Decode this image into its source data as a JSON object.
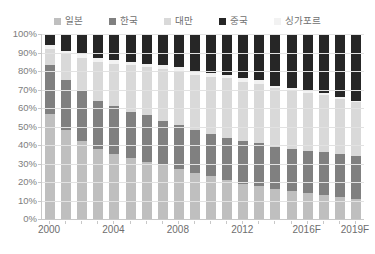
{
  "chart_data": {
    "type": "bar",
    "subtype": "stacked-percent",
    "title": "",
    "xlabel": "",
    "ylabel": "",
    "ylim": [
      0,
      100
    ],
    "ytick_labels": [
      "100%",
      "90%",
      "80%",
      "70%",
      "60%",
      "50%",
      "40%",
      "30%",
      "20%",
      "10%",
      "0%"
    ],
    "ytick_values": [
      100,
      90,
      80,
      70,
      60,
      50,
      40,
      30,
      20,
      10,
      0
    ],
    "grid": true,
    "legend_position": "top",
    "categories": [
      "2000",
      "2001",
      "2002",
      "2003",
      "2004",
      "2005",
      "2006",
      "2007",
      "2008",
      "2009",
      "2010",
      "2011",
      "2012",
      "2013",
      "2014",
      "2015",
      "2016F",
      "2017F",
      "2018F",
      "2019F"
    ],
    "xtick_labels_shown": [
      "2000",
      "2004",
      "2008",
      "2012",
      "2016F",
      "2019F"
    ],
    "series": [
      {
        "name": "일본",
        "color": "#bfbfbf",
        "values": [
          57,
          48,
          42,
          38,
          35,
          33,
          31,
          29,
          27,
          25,
          23,
          21,
          19,
          18,
          16,
          15,
          14,
          13,
          12,
          11
        ]
      },
      {
        "name": "한국",
        "color": "#808080",
        "values": [
          26,
          27,
          27,
          26,
          26,
          25,
          25,
          24,
          24,
          23,
          23,
          23,
          23,
          23,
          23,
          23,
          23,
          23,
          23,
          23
        ]
      },
      {
        "name": "대만",
        "color": "#d9d9d9",
        "values": [
          9,
          14,
          18,
          21,
          23,
          25,
          26,
          28,
          29,
          30,
          31,
          32,
          32,
          32,
          32,
          32,
          31,
          31,
          30,
          29
        ]
      },
      {
        "name": "싱가포르",
        "color": "#f2f2f2",
        "values": [
          2,
          2,
          2,
          2,
          2,
          2,
          2,
          2,
          2,
          2,
          2,
          2,
          2,
          2,
          1,
          1,
          1,
          1,
          1,
          1
        ]
      },
      {
        "name": "중국",
        "color": "#262626",
        "values": [
          6,
          9,
          11,
          13,
          14,
          15,
          16,
          17,
          18,
          20,
          21,
          22,
          24,
          25,
          28,
          29,
          31,
          32,
          34,
          36
        ]
      }
    ],
    "stack_order_bottom_to_top": [
      "일본",
      "한국",
      "대만",
      "싱가포르",
      "중국"
    ],
    "axis_color": "#c8c8c8",
    "grid_color": "#e2e2e2",
    "text_color": "#7b7b7b",
    "background": "#ffffff"
  }
}
